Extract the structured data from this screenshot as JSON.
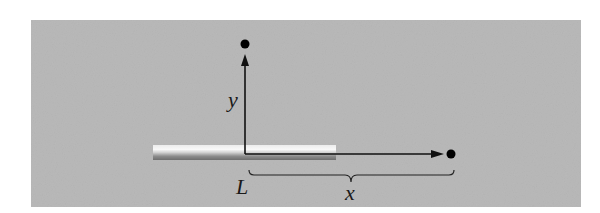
{
  "figure": {
    "type": "physics-diagram",
    "labels": {
      "y_axis": "y",
      "x_distance": "x",
      "rod_length": "L"
    },
    "colors": {
      "background_panel": "#b9b9b9",
      "axis": "#111111",
      "point": "#000000",
      "rod_light": "#f2f2f2",
      "rod_dark": "#6e6e6e"
    },
    "elements": [
      {
        "kind": "rod",
        "label_ref": "rod_length"
      },
      {
        "kind": "axis",
        "direction": "vertical",
        "label_ref": "y_axis"
      },
      {
        "kind": "axis",
        "direction": "horizontal"
      },
      {
        "kind": "point",
        "location": "on y-axis"
      },
      {
        "kind": "point",
        "location": "on x-axis"
      },
      {
        "kind": "brace",
        "label_ref": "x_distance"
      }
    ]
  }
}
